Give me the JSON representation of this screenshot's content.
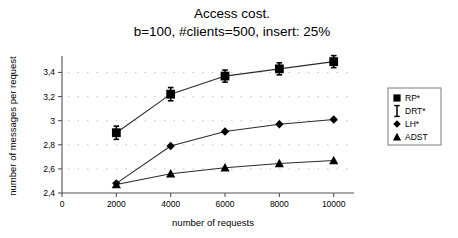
{
  "chart_data": {
    "type": "line",
    "title": "Access cost.",
    "subtitle": "b=100, #clients=500, insert: 25%",
    "xlabel": "number of requests",
    "ylabel": "number of messages per request",
    "x": [
      2000,
      4000,
      6000,
      8000,
      10000
    ],
    "xlim": [
      0,
      10600
    ],
    "ylim": [
      2.4,
      3.52
    ],
    "xticks": [
      0,
      2000,
      4000,
      6000,
      8000,
      10000
    ],
    "xticklabels": [
      "0",
      "2000",
      "4000",
      "6000",
      "8000",
      "10000"
    ],
    "yticks": [
      2.4,
      2.6,
      2.8,
      3.0,
      3.2,
      3.4
    ],
    "yticklabels": [
      "2,4",
      "2,6",
      "2,8",
      "3",
      "3,2",
      "3,4"
    ],
    "grid": "dotted",
    "legend_position": "right",
    "series": [
      {
        "name": "RP*",
        "marker": "square",
        "values": [
          2.9,
          3.22,
          3.37,
          3.43,
          3.49
        ],
        "errors": [
          0.055,
          0.055,
          0.05,
          0.05,
          0.05
        ]
      },
      {
        "name": "DRT*",
        "marker": "ibeam",
        "values": null,
        "errors": null
      },
      {
        "name": "LH*",
        "marker": "diamond",
        "values": [
          2.48,
          2.79,
          2.91,
          2.97,
          3.01
        ],
        "errors": null
      },
      {
        "name": "ADST",
        "marker": "triangle",
        "values": [
          2.47,
          2.56,
          2.61,
          2.645,
          2.67
        ],
        "errors": null
      }
    ],
    "legend": [
      {
        "label": "RP*",
        "marker": "square"
      },
      {
        "label": "DRT*",
        "marker": "ibeam"
      },
      {
        "label": "LH*",
        "marker": "diamond"
      },
      {
        "label": "ADST",
        "marker": "triangle"
      }
    ],
    "colors": {
      "line": "#2b2b2b",
      "marker": "#000000",
      "axis": "#555555",
      "grid": "#b8b8b8",
      "background": "#ffffff"
    }
  }
}
